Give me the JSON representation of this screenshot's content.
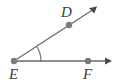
{
  "figure": {
    "type": "geometry-diagram",
    "subtype": "angle",
    "background_color": "#ffffff",
    "stroke_color": "#6b6b6b",
    "point_color": "#7a7a7a",
    "label_color": "#3d3d3d",
    "canvas": {
      "width": 118,
      "height": 83
    }
  },
  "points": [
    {
      "id": "E",
      "label": "E",
      "role": "vertex",
      "x": 14,
      "y": 61,
      "label_x": 9,
      "label_y": 79
    },
    {
      "id": "D",
      "label": "D",
      "role": "ray-point",
      "x": 69,
      "y": 25,
      "label_x": 61,
      "label_y": 17
    },
    {
      "id": "F",
      "label": "F",
      "role": "ray-point",
      "x": 88,
      "y": 61,
      "label_x": 83,
      "label_y": 79
    }
  ],
  "rays": [
    {
      "id": "ray-ED",
      "label": "ray ED",
      "from": "E",
      "through": "D",
      "start": {
        "x": 14,
        "y": 61
      },
      "end": {
        "x": 97,
        "y": 7
      },
      "arrowhead": true
    },
    {
      "id": "ray-EF",
      "label": "ray EF",
      "from": "E",
      "through": "F",
      "start": {
        "x": 14,
        "y": 61
      },
      "end": {
        "x": 112,
        "y": 61
      },
      "arrowhead": true
    }
  ],
  "angle_arc": {
    "id": "angle-DEF",
    "label": "angle DEF",
    "vertex": "E",
    "radius": 27,
    "path": "M 41 61 A 27 27 0 0 0 36.6 46.2"
  },
  "accessibility": {
    "description": "Two rays sharing vertex E. One ray goes right through F horizontally, the other goes up and to the right through D. A small arc marks the angle at E."
  }
}
